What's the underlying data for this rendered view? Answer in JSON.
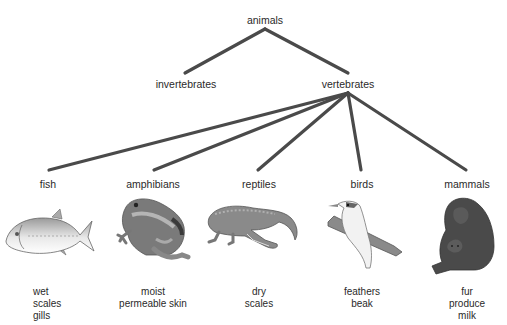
{
  "root": {
    "label": "animals"
  },
  "level1": [
    {
      "label": "invertebrates"
    },
    {
      "label": "vertebrates"
    }
  ],
  "groups": [
    {
      "label": "fish",
      "traits": [
        "wet",
        "scales",
        "gills"
      ],
      "icon": "fish-icon"
    },
    {
      "label": "amphibians",
      "traits": [
        "moist",
        "permeable skin"
      ],
      "icon": "frog-icon"
    },
    {
      "label": "reptiles",
      "traits": [
        "dry",
        "scales"
      ],
      "icon": "crocodile-icon"
    },
    {
      "label": "birds",
      "traits": [
        "feathers",
        "beak"
      ],
      "icon": "bird-icon"
    },
    {
      "label": "mammals",
      "traits": [
        "fur",
        "produce milk"
      ],
      "icon": "gorilla-icon"
    }
  ],
  "colors": {
    "line": "#4a4a4a",
    "text": "#2a2a2a"
  }
}
